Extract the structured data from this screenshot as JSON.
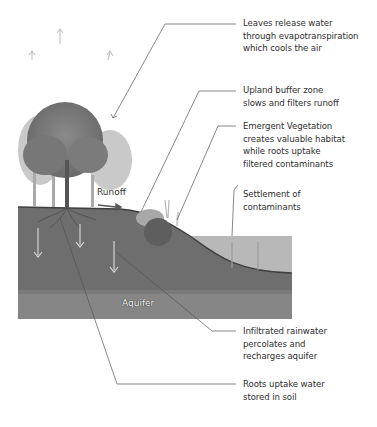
{
  "diagram": {
    "type": "cross-section illustration",
    "palette": {
      "background": "#ffffff",
      "soil": "#6f6f6f",
      "aquifer": "#8a8a8a",
      "water": "#b5b5b5",
      "leader_line": "#555555",
      "text": "#2f2f2f"
    },
    "inline_labels": {
      "runoff": "Runoff",
      "aquifer": "Aquifer"
    },
    "callouts": [
      {
        "id": "evapotranspiration",
        "lines": [
          "Leaves release water",
          "through evapotranspiration",
          "which cools the air"
        ]
      },
      {
        "id": "upland-buffer",
        "lines": [
          "Upland buffer zone",
          "slows and filters runoff"
        ]
      },
      {
        "id": "emergent-vegetation",
        "lines": [
          "Emergent Vegetation",
          "creates valuable habitat",
          "while roots uptake",
          "filtered contaminants"
        ]
      },
      {
        "id": "settlement",
        "lines": [
          "Settlement of",
          "contaminants"
        ]
      },
      {
        "id": "infiltration",
        "lines": [
          "Infiltrated rainwater",
          "percolates and",
          "recharges aquifer"
        ]
      },
      {
        "id": "roots-uptake",
        "lines": [
          "Roots uptake water",
          "stored in soil"
        ]
      }
    ]
  }
}
